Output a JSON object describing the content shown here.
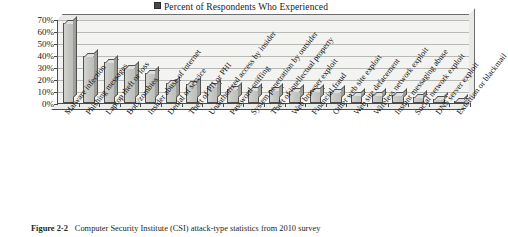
{
  "legend": {
    "marker": "square-marker-icon",
    "label": "Percent of Respondents Who Experienced"
  },
  "caption": {
    "figure_number": "Figure 2-2",
    "text": "Computer Security Institute (CSI) attack-type statistics from 2010 survey"
  },
  "colors": {
    "bar_face": "#c7c7c3",
    "bar_top": "#dedede",
    "bar_side": "#9e9e9a",
    "bar_outline": "#4f4f4f",
    "plot_background": "#f3f3f1",
    "gridline": "#b9b9b5",
    "axis": "#4a4a4a",
    "text": "#1a1a1a"
  },
  "chart_data": {
    "type": "bar",
    "title": "",
    "subtitle": "",
    "xlabel": "",
    "ylabel": "",
    "ylim": [
      0,
      70
    ],
    "ytick_labels": [
      "0%",
      "10%",
      "20%",
      "30%",
      "40%",
      "50%",
      "60%",
      "70%"
    ],
    "ytick_values": [
      0,
      10,
      20,
      30,
      40,
      50,
      60,
      70
    ],
    "grid": true,
    "legend_position": "top-center",
    "series_name": "Percent of Respondents Who Experienced",
    "categories": [
      "Malware infection",
      "Phishing messages",
      "Laptop theft or loss",
      "Bots/zombies",
      "Insider abuse of internet",
      "Denial of service",
      "Theft of PII or PHI",
      "Unauthorized access by insider",
      "Password sniffing",
      "System penetration by outsider",
      "Theft of intellectual property",
      "Web browser exploit",
      "Financial fraud",
      "Other web site exploit",
      "Web site defacement",
      "Wireless network exploit",
      "Instant messaging abuse",
      "Social network exploit",
      "DNS server exploit",
      "Extortion or blackmail"
    ],
    "values": [
      67,
      39,
      34,
      29,
      25,
      17,
      16,
      14,
      12,
      11,
      11,
      10,
      10,
      9,
      7,
      7,
      7,
      5,
      3,
      2
    ]
  }
}
